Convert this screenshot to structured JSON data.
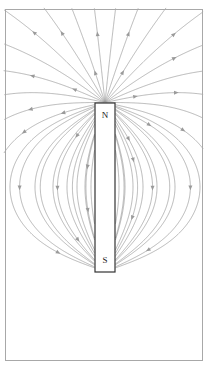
{
  "figure": {
    "width": 207,
    "height": 368,
    "background_color": "#ffffff"
  },
  "frame": {
    "name": "diagram-border",
    "x": 5,
    "y": 9,
    "width": 197,
    "height": 351,
    "stroke_color": "#a8a8a8",
    "stroke_width": 1,
    "fill": "none"
  },
  "magnet": {
    "name": "bar-magnet",
    "x": 95,
    "y": 103,
    "width": 20,
    "height": 169,
    "fill_color": "#ffffff",
    "stroke_color": "#333333",
    "stroke_width": 1.2,
    "north_label": "N",
    "south_label": "S",
    "north_label_x": 105,
    "north_label_y": 116,
    "south_label_x": 105,
    "south_label_y": 261
  },
  "field_lines": {
    "name": "magnetic-field-lines",
    "stroke_color": "#9a9a9a",
    "stroke_width": 0.7,
    "arrow_color": "#9a9a9a",
    "description": "Dipole field lines emerging from the N pole at the top, looping around and re-entering at the S pole at the bottom.",
    "dipole_center_x": 105,
    "dipole_center_y": 187,
    "pole_separation": 169,
    "loop_radii": [
      6,
      11,
      17,
      24,
      32,
      41,
      51,
      62,
      74,
      88,
      104,
      122,
      143,
      168,
      198,
      236,
      285,
      350,
      440,
      570
    ],
    "arrow_count": 46
  },
  "chart_data": {
    "type": "diagram",
    "annotations": [
      "N",
      "S"
    ],
    "legend": [],
    "xlabel": "",
    "ylabel": ""
  }
}
